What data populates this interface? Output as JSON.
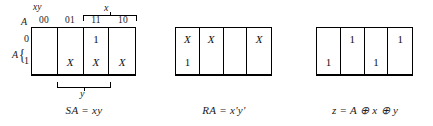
{
  "figure": {
    "line_color": "#000000",
    "background": "#ffffff"
  },
  "maps": [
    {
      "id": "SA",
      "axis": {
        "column_group_label": "xy",
        "column_headers": [
          "00",
          "01",
          "11",
          "10"
        ],
        "top_bracket_label": "x",
        "bottom_bracket_label": "y",
        "corner_label": "A",
        "row_labels": [
          "0",
          "1"
        ],
        "row_group_label": "A",
        "row_group_brace": "{"
      },
      "cells": [
        [
          "",
          "",
          "1",
          ""
        ],
        [
          "",
          "X",
          "X",
          "X"
        ]
      ],
      "caption": {
        "lhs": "SA",
        "eq": "=",
        "rhs": "xy",
        "full": "SA = xy"
      }
    },
    {
      "id": "RA",
      "cells": [
        [
          "X",
          "X",
          "",
          "X"
        ],
        [
          "1",
          "",
          "",
          ""
        ]
      ],
      "caption": {
        "lhs": "RA",
        "eq": "=",
        "rhs": "x'y'",
        "full": "RA = x'y'"
      }
    },
    {
      "id": "z",
      "cells": [
        [
          "",
          "1",
          "",
          "1"
        ],
        [
          "1",
          "",
          "1",
          ""
        ]
      ],
      "caption": {
        "lhs": "z",
        "eq": "=",
        "rhs": "A ⊕ x ⊕ y",
        "full": "z = A ⊕ x ⊕ y"
      }
    }
  ]
}
